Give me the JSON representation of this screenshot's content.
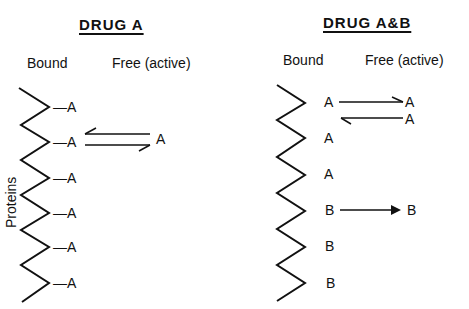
{
  "panels": {
    "left": {
      "title": "DRUG A",
      "bound_header": "Bound",
      "free_header": "Free (active)",
      "axis_label": "Proteins",
      "bound_labels": [
        "—A",
        "—A",
        "—A",
        "—A",
        "—A",
        "—A"
      ],
      "free_labels": [
        "A"
      ],
      "arrows": [
        {
          "from": "bound-2",
          "to": "free",
          "type": "equilibrium"
        }
      ]
    },
    "right": {
      "title": "DRUG A&B",
      "bound_header": "Bound",
      "free_header": "Free (active)",
      "bound_labels": [
        "A",
        "A",
        "A",
        "B",
        "B",
        "B"
      ],
      "free_labels": [
        "A",
        "A",
        "B"
      ],
      "arrows": [
        {
          "from": "bound-1",
          "to": "free-A1",
          "type": "forward"
        },
        {
          "from": "free-A2",
          "to": "bound-1",
          "type": "backward"
        },
        {
          "from": "bound-4",
          "to": "free-B",
          "type": "forward"
        }
      ]
    }
  }
}
